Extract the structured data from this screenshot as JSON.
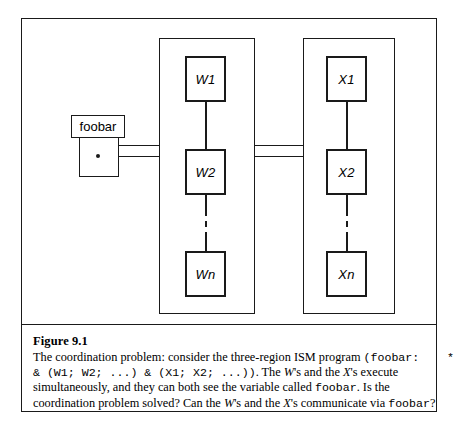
{
  "figure": {
    "caption_title": "Figure 9.1",
    "caption_lines": [
      "The coordination problem: consider the three-region ISM program (foobar:    *",
      "& (W1; W2; ...) & (X1; X2; ...)). The W's and the X's execute",
      "simultaneously, and they can both see the variable called foobar. Is the",
      "coordination problem solved? Can the W's and the X's communicate via foobar?"
    ],
    "caption_segments": {
      "line1": {
        "a": "The coordination problem: consider the three-region ISM program ",
        "b": "(foobar:    *",
        "c": ""
      },
      "line2": {
        "a": "& (W1; W2; ...) & (X1; X2; ...))",
        "b": ". The ",
        "c": "W",
        "d": "'s and the ",
        "e": "X",
        "f": "'s execute"
      },
      "line3": {
        "a": "simultaneously, and they can both see the variable called ",
        "b": "foobar",
        "c": ". Is the"
      },
      "line4": {
        "a": "coordination problem solved? Can the ",
        "b": "W",
        "c": "'s and the ",
        "d": "X",
        "e": "'s communicate via ",
        "f": "foobar",
        "g": "?"
      }
    }
  },
  "diagram": {
    "variable": {
      "name": "foobar",
      "value_marker": "*"
    },
    "regions": [
      {
        "id": "w-region",
        "nodes": [
          {
            "label": "W1"
          },
          {
            "label": "W2"
          },
          {
            "label": "Wn"
          }
        ],
        "ellipsis_between": [
          1,
          2
        ]
      },
      {
        "id": "x-region",
        "nodes": [
          {
            "label": "X1"
          },
          {
            "label": "X2"
          },
          {
            "label": "Xn"
          }
        ],
        "ellipsis_between": [
          1,
          2
        ]
      }
    ],
    "colors": {
      "ink": "#1a1a1a",
      "paper": "#ffffff"
    }
  }
}
